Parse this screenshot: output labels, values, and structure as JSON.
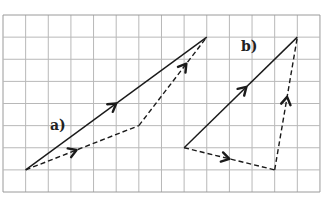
{
  "diagram": {
    "type": "vector-addition-on-grid",
    "grid": {
      "origin_px": [
        3,
        15
      ],
      "cols": 14,
      "rows": 8,
      "cell_w": 22.64,
      "cell_h": 22.125,
      "line_color": "#b8b8b8",
      "border_color": "#9a9a9a"
    },
    "line_color": "#1a1a1a",
    "figures": [
      {
        "id": "a",
        "label": "a)",
        "label_pos_px": [
          50,
          130
        ],
        "resultant": {
          "from": [
            1,
            7
          ],
          "to": [
            9,
            1
          ],
          "style": "solid",
          "arrow_t": 0.5
        },
        "components": [
          {
            "from": [
              1,
              7
            ],
            "to": [
              6,
              5
            ],
            "style": "dashed",
            "arrow_t": 0.45
          },
          {
            "from": [
              6,
              5
            ],
            "to": [
              9,
              1
            ],
            "style": "dashed",
            "arrow_t": 0.7
          }
        ]
      },
      {
        "id": "b",
        "label": "b)",
        "label_pos_px": [
          241,
          51
        ],
        "resultant": {
          "from": [
            8,
            6
          ],
          "to": [
            13,
            1
          ],
          "style": "solid",
          "arrow_t": 0.55
        },
        "components": [
          {
            "from": [
              8,
              6
            ],
            "to": [
              12,
              7
            ],
            "style": "dashed",
            "arrow_t": 0.5
          },
          {
            "from": [
              12,
              7
            ],
            "to": [
              13,
              1
            ],
            "style": "dashed",
            "arrow_t": 0.55
          }
        ]
      }
    ]
  }
}
